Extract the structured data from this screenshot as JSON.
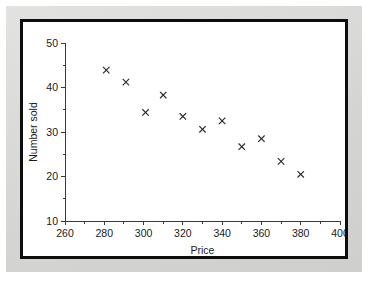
{
  "figure": {
    "background_color": "#ffffff",
    "page_color": "#d8d8d6",
    "frame_color": "#0d0d0d"
  },
  "chart_data": {
    "type": "scatter",
    "title": "",
    "subtitle": "",
    "xlabel": "Price",
    "ylabel": "Number sold",
    "xlim": [
      260,
      400
    ],
    "ylim": [
      10,
      50
    ],
    "xticks": [
      260,
      280,
      300,
      320,
      340,
      360,
      380,
      400
    ],
    "xtick_labels": [
      "260",
      "280",
      "300",
      "320",
      "340",
      "360",
      "380",
      "400"
    ],
    "yticks": [
      10,
      20,
      30,
      40,
      50
    ],
    "ytick_labels": [
      "10",
      "20",
      "30",
      "40",
      "50"
    ],
    "x_minor_tick_interval": 10,
    "y_minor_tick_interval": 5,
    "grid": false,
    "legend": null,
    "marker": "x",
    "marker_color": "#2b2b2b",
    "points": [
      {
        "x": 281,
        "y": 43.9
      },
      {
        "x": 291,
        "y": 41.2
      },
      {
        "x": 301,
        "y": 34.4
      },
      {
        "x": 310,
        "y": 38.3
      },
      {
        "x": 320,
        "y": 33.5
      },
      {
        "x": 330,
        "y": 30.6
      },
      {
        "x": 340,
        "y": 32.5
      },
      {
        "x": 350,
        "y": 26.7
      },
      {
        "x": 360,
        "y": 28.5
      },
      {
        "x": 370,
        "y": 23.4
      },
      {
        "x": 380,
        "y": 20.5
      }
    ],
    "series": [
      {
        "name": "Number sold vs Price",
        "x": [
          281,
          291,
          301,
          310,
          320,
          330,
          340,
          350,
          360,
          370,
          380
        ],
        "values": [
          43.9,
          41.2,
          34.4,
          38.3,
          33.5,
          30.6,
          32.5,
          26.7,
          28.5,
          23.4,
          20.5
        ]
      }
    ]
  }
}
